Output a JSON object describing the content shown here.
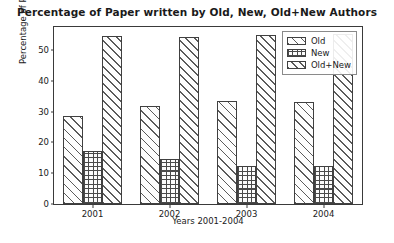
{
  "chart_data": {
    "type": "bar",
    "title": "Percentage of Paper written by Old, New, Old+New Authors",
    "xlabel": "Years 2001-2004",
    "ylabel": "Percentage of Papers",
    "categories": [
      "2001",
      "2002",
      "2003",
      "2004"
    ],
    "series": [
      {
        "name": "Old",
        "values": [
          28.7,
          32.0,
          33.4,
          33.2
        ],
        "hatch": "diagonal"
      },
      {
        "name": "New",
        "values": [
          17.2,
          14.6,
          12.5,
          12.3
        ],
        "hatch": "crosshatch"
      },
      {
        "name": "Old+New",
        "values": [
          54.5,
          54.2,
          54.8,
          55.2
        ],
        "hatch": "diagonal"
      }
    ],
    "ylim": [
      0,
      57.5
    ],
    "yticks": [
      0,
      10,
      20,
      30,
      40,
      50
    ],
    "ytick_labels": [
      "0",
      "10",
      "20",
      "30",
      "40",
      "50"
    ],
    "grid": false,
    "legend_position": "upper right",
    "bar_edge_color": "#404040",
    "bar_face_color": "#ffffff",
    "frame_color": "#3a3a3a"
  },
  "legend": {
    "entries": [
      {
        "label": "Old"
      },
      {
        "label": "New"
      },
      {
        "label": "Old+New"
      }
    ]
  }
}
